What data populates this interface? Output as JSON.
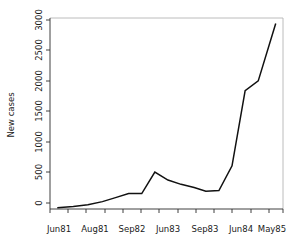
{
  "chart_data": {
    "type": "line",
    "title": "",
    "subtitle": "",
    "xlabel": "",
    "ylabel": "New cases",
    "xlim": [
      0,
      16
    ],
    "ylim": [
      0,
      3100
    ],
    "grid": false,
    "legend": null,
    "y_ticks": [
      0,
      500,
      1000,
      1500,
      2000,
      2500,
      3000
    ],
    "y_tick_labels": [
      "0",
      "500",
      "1000",
      "1500",
      "2000",
      "2500",
      "3000"
    ],
    "x_tick_labels": [
      "Jun81",
      "Aug81",
      "Sep82",
      "Jun83",
      "Sep83",
      "Jun84",
      "May85"
    ],
    "x_tick_positions": [
      0.5,
      3.0,
      5.5,
      8.0,
      10.5,
      13.0,
      15.5
    ],
    "x_minor_tick_positions": [
      0.0,
      1.25,
      2.5,
      3.75,
      5.0,
      6.25,
      7.5,
      8.75,
      10.0,
      11.25,
      12.5,
      13.75,
      15.0,
      16.0
    ],
    "series": [
      {
        "name": "New cases",
        "x": [
          0.5,
          1.6,
          2.6,
          3.6,
          4.5,
          5.4,
          6.3,
          7.2,
          8.1,
          9.0,
          9.9,
          10.7,
          11.6,
          12.5,
          13.4,
          14.3,
          15.5
        ],
        "values": [
          20,
          40,
          70,
          120,
          185,
          250,
          250,
          600,
          470,
          400,
          350,
          290,
          300,
          700,
          1920,
          2080,
          3010
        ]
      }
    ],
    "line_color": "#111111",
    "axis_color": "#2b2b2b",
    "box_color": "#b4b4b4",
    "background_color": "#ffffff"
  },
  "axes": {
    "ylabel": "New cases"
  }
}
